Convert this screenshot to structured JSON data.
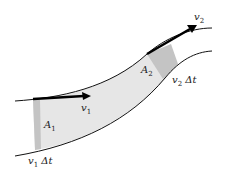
{
  "diagram": {
    "labels": {
      "v2": {
        "base": "v",
        "sub": "2"
      },
      "v1": {
        "base": "v",
        "sub": "1"
      },
      "A2": {
        "base": "A",
        "sub": "2"
      },
      "A1": {
        "base": "A",
        "sub": "1"
      },
      "v2dt": {
        "base": "v",
        "sub": "2",
        "suffix": " Δt"
      },
      "v1dt": {
        "base": "v",
        "sub": "1",
        "suffix": " Δt"
      }
    },
    "colors": {
      "tube_fill": "#e6e6e6",
      "slab_fill": "#c4c4c4",
      "outline": "#111111",
      "arrow": "#000000"
    }
  }
}
